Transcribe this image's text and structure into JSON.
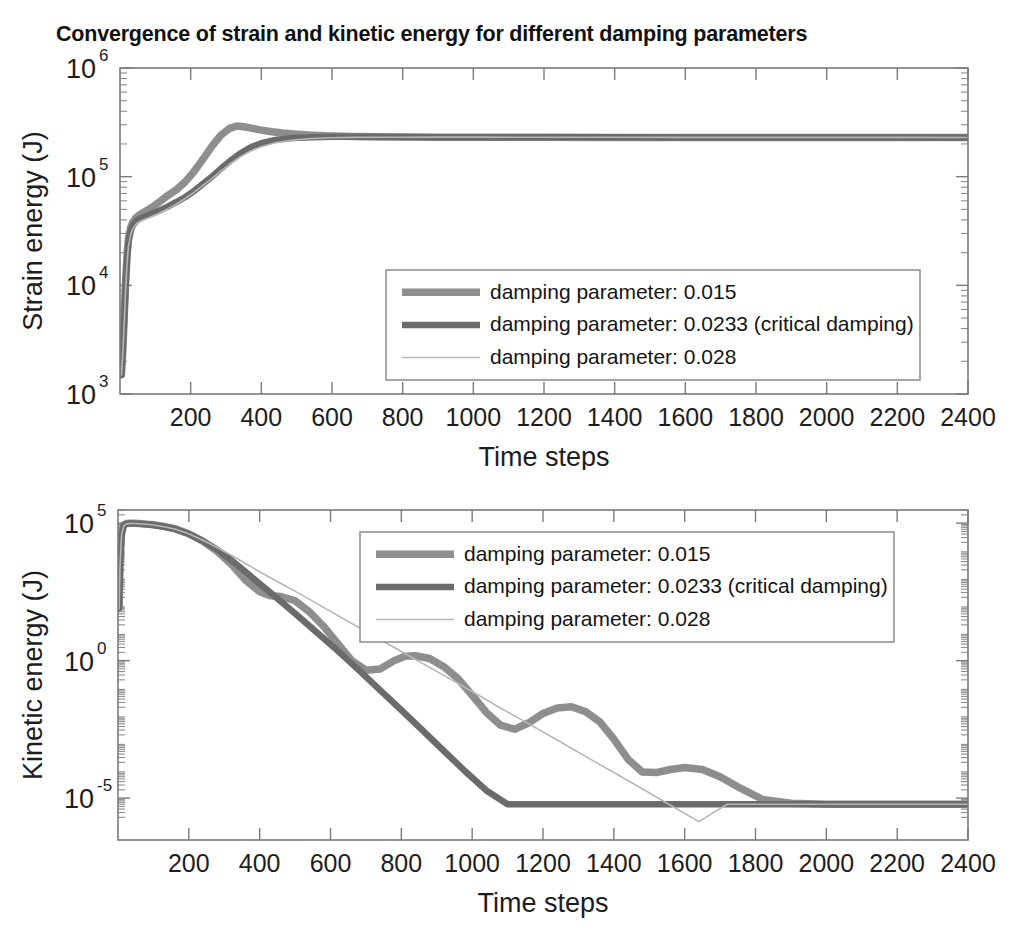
{
  "title": "Convergence of strain and kinetic energy for different damping parameters",
  "series_colors": {
    "s1": "#8e8e8e",
    "s2": "#6b6b6b",
    "s3": "#b7b7b7"
  },
  "series_widths": {
    "s1": 7.5,
    "s2": 6.5,
    "s3": 1.6
  },
  "legend": {
    "entries": [
      {
        "label": "damping parameter: 0.015",
        "key": "s1"
      },
      {
        "label": "damping parameter: 0.0233 (critical damping)",
        "key": "s2"
      },
      {
        "label": "damping parameter: 0.028",
        "key": "s3"
      }
    ]
  },
  "chart_data": [
    {
      "type": "line",
      "id": "strain-energy",
      "title": "Convergence of strain and kinetic energy for different damping parameters",
      "xlabel": "Time steps",
      "ylabel": "Strain energy (J)",
      "xlim": [
        0,
        2400
      ],
      "ylim": [
        1000,
        1000000
      ],
      "yscale": "log",
      "xticks": [
        200,
        400,
        600,
        800,
        1000,
        1200,
        1400,
        1600,
        1800,
        2000,
        2200,
        2400
      ],
      "yticks": [
        1000,
        10000,
        100000,
        1000000
      ],
      "yticklabels": [
        "10^3",
        "10^4",
        "10^5",
        "10^6"
      ],
      "grid": false,
      "legend_position": "lower-right",
      "series": [
        {
          "name": "damping parameter: 0.015",
          "key": "s1",
          "x": [
            4,
            8,
            12,
            16,
            20,
            24,
            30,
            36,
            44,
            55,
            70,
            90,
            110,
            135,
            160,
            185,
            210,
            235,
            260,
            285,
            310,
            330,
            350,
            375,
            400,
            430,
            460,
            500,
            545,
            600,
            660,
            730,
            800,
            900,
            1000,
            1200,
            1400,
            1600,
            1800,
            2000,
            2200,
            2400
          ],
          "y": [
            1500,
            2600,
            5200,
            11000,
            19000,
            27000,
            34000,
            38000,
            41500,
            44500,
            47500,
            52000,
            58000,
            67000,
            76000,
            90000,
            112000,
            145000,
            190000,
            240000,
            278000,
            292000,
            288000,
            278000,
            268000,
            259000,
            252000,
            246000,
            241000,
            237000,
            234500,
            233000,
            232000,
            231000,
            230500,
            230000,
            229800,
            229600,
            229500,
            229400,
            229300,
            229200
          ]
        },
        {
          "name": "damping parameter: 0.0233 (critical damping)",
          "key": "s2",
          "x": [
            4,
            8,
            12,
            16,
            20,
            24,
            30,
            36,
            44,
            55,
            70,
            90,
            110,
            135,
            160,
            185,
            210,
            235,
            260,
            285,
            310,
            340,
            370,
            400,
            440,
            490,
            545,
            600,
            660,
            730,
            800,
            900,
            1000,
            1200,
            1400,
            1600,
            1800,
            2000,
            2200,
            2400
          ],
          "y": [
            1500,
            2500,
            4800,
            10000,
            17500,
            25000,
            31500,
            35500,
            38500,
            41000,
            43000,
            45500,
            48500,
            53000,
            58500,
            65000,
            74000,
            86000,
            100000,
            118000,
            138000,
            163000,
            186000,
            203000,
            218000,
            227000,
            231000,
            232500,
            232500,
            232000,
            231500,
            231000,
            230600,
            230200,
            230000,
            229800,
            229700,
            229600,
            229500,
            229400
          ]
        },
        {
          "name": "damping parameter: 0.028",
          "key": "s3",
          "x": [
            4,
            8,
            12,
            16,
            20,
            24,
            30,
            36,
            44,
            55,
            70,
            90,
            110,
            135,
            160,
            185,
            210,
            235,
            260,
            285,
            310,
            340,
            370,
            400,
            440,
            490,
            545,
            600,
            660,
            730,
            800,
            900,
            1000,
            1200,
            1400,
            1600,
            1800,
            2000,
            2200,
            2400
          ],
          "y": [
            1500,
            2400,
            4500,
            9200,
            16000,
            23000,
            29000,
            33000,
            36000,
            38500,
            40500,
            43000,
            46000,
            50500,
            56000,
            63000,
            72000,
            83000,
            96000,
            112000,
            130000,
            152000,
            172000,
            189000,
            205000,
            217000,
            224500,
            228000,
            229800,
            230500,
            230800,
            231000,
            230900,
            230500,
            230200,
            230000,
            229900,
            229800,
            229700,
            229600
          ]
        }
      ]
    },
    {
      "type": "line",
      "id": "kinetic-energy",
      "xlabel": "Time steps",
      "ylabel": "Kinetic energy (J)",
      "xlim": [
        0,
        2400
      ],
      "ylim": [
        3e-07,
        300000
      ],
      "yscale": "log",
      "xticks": [
        200,
        400,
        600,
        800,
        1000,
        1200,
        1400,
        1600,
        1800,
        2000,
        2200,
        2400
      ],
      "yticks": [
        1e-05,
        1,
        100000
      ],
      "yticklabels": [
        "10^-5",
        "10^0",
        "10^5"
      ],
      "grid": false,
      "legend_position": "upper-center",
      "series": [
        {
          "name": "damping parameter: 0.015",
          "key": "s1",
          "x": [
            3,
            6,
            10,
            16,
            24,
            34,
            46,
            60,
            80,
            100,
            130,
            160,
            200,
            240,
            280,
            320,
            360,
            400,
            430,
            460,
            500,
            540,
            580,
            620,
            660,
            700,
            740,
            780,
            810,
            840,
            880,
            920,
            960,
            1000,
            1040,
            1080,
            1120,
            1160,
            1200,
            1240,
            1280,
            1320,
            1360,
            1400,
            1440,
            1480,
            1520,
            1560,
            1600,
            1650,
            1700,
            1760,
            1820,
            1900,
            2000,
            2100,
            2200,
            2300,
            2400
          ],
          "y": [
            90,
            4500,
            40000,
            85000,
            97000,
            99000,
            98000,
            96000,
            92000,
            87000,
            76000,
            63000,
            41000,
            22000,
            9500,
            3200,
            850,
            320,
            230,
            215,
            150,
            60,
            18,
            4.2,
            1.0,
            0.45,
            0.5,
            1.0,
            1.45,
            1.5,
            1.2,
            0.6,
            0.22,
            0.055,
            0.013,
            0.0045,
            0.0032,
            0.0055,
            0.012,
            0.019,
            0.021,
            0.014,
            0.006,
            0.0014,
            0.00026,
            9e-05,
            8.5e-05,
            0.00011,
            0.00013,
            0.00011,
            6e-05,
            2.2e-05,
            9e-06,
            6.5e-06,
            6e-06,
            6e-06,
            6e-06,
            6e-06,
            6e-06
          ]
        },
        {
          "name": "damping parameter: 0.0233 (critical damping)",
          "key": "s2",
          "x": [
            3,
            6,
            10,
            16,
            24,
            34,
            46,
            60,
            80,
            100,
            130,
            160,
            200,
            240,
            280,
            320,
            360,
            400,
            450,
            500,
            560,
            620,
            680,
            740,
            800,
            860,
            920,
            980,
            1040,
            1100,
            1160,
            1220,
            1280,
            1340,
            1400,
            1460,
            1520,
            1600,
            1700,
            1800,
            1900,
            2000,
            2100,
            2200,
            2300,
            2400
          ],
          "y": [
            80,
            4000,
            38000,
            82000,
            95000,
            98000,
            97500,
            95500,
            91000,
            85500,
            74000,
            61000,
            40000,
            22000,
            11000,
            4500,
            1700,
            620,
            180,
            52,
            11,
            2.3,
            0.45,
            0.085,
            0.016,
            0.0029,
            0.00052,
            9.5e-05,
            1.9e-05,
            6e-06,
            6e-06,
            6e-06,
            6e-06,
            6e-06,
            6e-06,
            6e-06,
            6e-06,
            6e-06,
            6e-06,
            6e-06,
            6e-06,
            6e-06,
            6e-06,
            6e-06,
            6e-06,
            6e-06
          ]
        },
        {
          "name": "damping parameter: 0.028",
          "key": "s3",
          "x": [
            3,
            6,
            10,
            16,
            24,
            34,
            46,
            60,
            80,
            100,
            130,
            160,
            200,
            240,
            280,
            320,
            360,
            400,
            460,
            520,
            600,
            680,
            760,
            840,
            920,
            1000,
            1080,
            1160,
            1240,
            1320,
            1400,
            1480,
            1560,
            1640,
            1720,
            1800,
            1880,
            1950,
            2000,
            2060,
            2120,
            2200,
            2300,
            2400
          ],
          "y": [
            75,
            3800,
            36000,
            80000,
            94000,
            97500,
            97000,
            95000,
            90500,
            85000,
            73500,
            61500,
            41000,
            24000,
            13000,
            6800,
            3400,
            1700,
            640,
            240,
            62,
            16,
            4.2,
            1.1,
            0.29,
            0.075,
            0.019,
            0.005,
            0.0013,
            0.00033,
            8.5e-05,
            2.2e-05,
            5.5e-06,
            1.4e-06,
            6e-06,
            6e-06,
            6e-06,
            6e-06,
            6e-06,
            6e-06,
            6e-06,
            6e-06,
            6e-06,
            6e-06
          ]
        }
      ]
    }
  ]
}
